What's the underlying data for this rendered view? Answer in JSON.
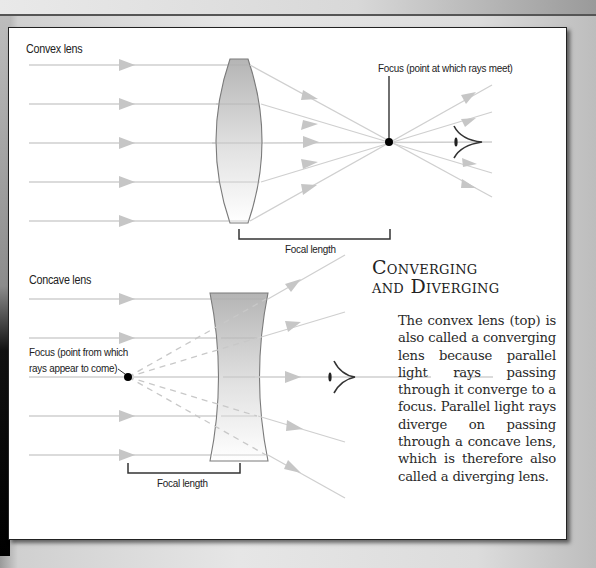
{
  "convex": {
    "title": "Convex lens",
    "focus_label": "Focus (point at which rays meet)",
    "focal_length_label": "Focal length"
  },
  "concave": {
    "title": "Concave lens",
    "focus_label": "Focus (point from which\nrays appear to come)",
    "focal_length_label": "Focal length"
  },
  "sidebar": {
    "title_line1": "Converging",
    "title_line2": "and Diverging",
    "body": "The convex lens (top) is also called a con­verging lens because parallel light rays passing through it converge to a focus. Parallel light rays diverge on passing through a concave lens, which is there­fore also called a diverging lens."
  },
  "colors": {
    "ray": "#c8c8c8",
    "lens_outline": "#777777",
    "lens_fill_top": "#b8b8b8",
    "lens_fill_bottom": "#ffffff",
    "focus_dot": "#000000",
    "bracket": "#333333",
    "card_border": "#222222"
  }
}
